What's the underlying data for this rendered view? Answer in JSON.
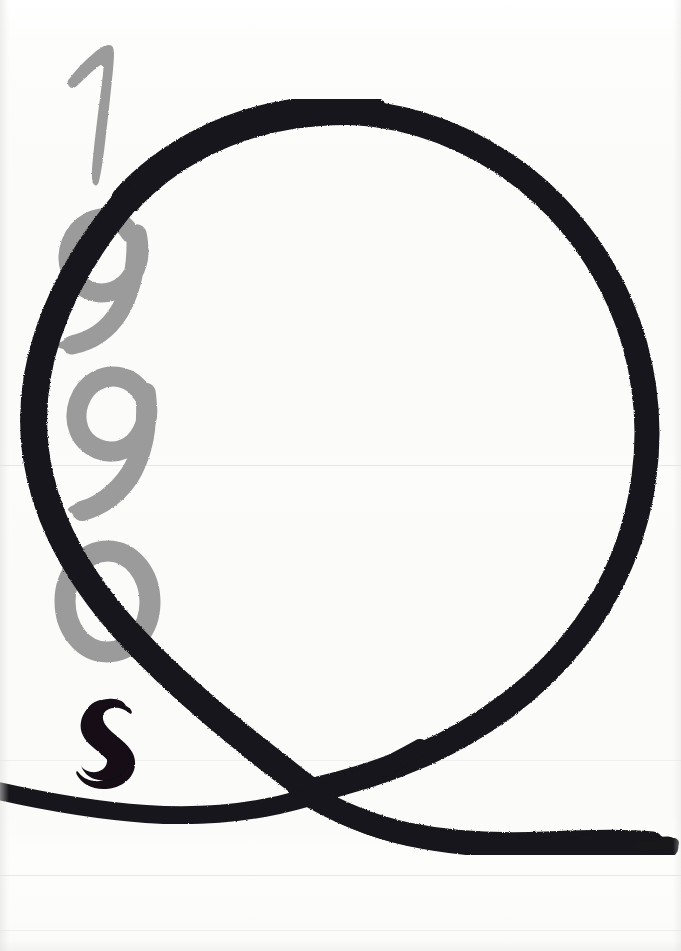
{
  "artwork": {
    "title": "1990s",
    "medium_note": "hand-painted brush lettering on paper",
    "canvas": {
      "width": 681,
      "height": 951
    },
    "background_color": "#fbfbfa",
    "ink_color": "#18171a",
    "gray_color": "#9b9b9b"
  },
  "text_content": {
    "full_reading": "1990s",
    "characters": [
      {
        "id": "char-1",
        "glyph": "1",
        "color": "#9b9b9b",
        "weight": "gray",
        "x": 68,
        "y": 45,
        "width": 60,
        "height": 135
      },
      {
        "id": "char-9-upper",
        "glyph": "9",
        "color": "#9b9b9b",
        "weight": "gray",
        "x": 44,
        "y": 200,
        "width": 106,
        "height": 150
      },
      {
        "id": "char-9-lower",
        "glyph": "9",
        "color": "#9b9b9b",
        "weight": "gray",
        "x": 62,
        "y": 360,
        "width": 100,
        "height": 148
      },
      {
        "id": "char-0",
        "glyph": "0",
        "color": "#9b9b9b",
        "weight": "gray",
        "x": 55,
        "y": 540,
        "width": 104,
        "height": 122
      },
      {
        "id": "char-s",
        "glyph": "s",
        "color": "#121114",
        "weight": "black",
        "x": 78,
        "y": 698,
        "width": 50,
        "height": 68
      }
    ]
  },
  "strokes": {
    "main_loop": {
      "name": "large-black-brush-loop",
      "color": "#18171a",
      "description": "big rounded loop resembling a Q, open at lower-left, crossing itself near the bottom",
      "extents": {
        "left": 30,
        "right": 652,
        "top": 108,
        "bottom": 860
      }
    },
    "tail": {
      "name": "black-brush-tail",
      "color": "#18171a",
      "description": "long horizontal tail sweeping from left edge across the bottom to the right edge",
      "extents": {
        "left": 0,
        "right": 681,
        "top": 780,
        "bottom": 858
      }
    }
  },
  "scan_artifacts": {
    "horizontal_lines_y": [
      465,
      760,
      875,
      930
    ],
    "note": "faint horizontal scanner banding lines"
  }
}
